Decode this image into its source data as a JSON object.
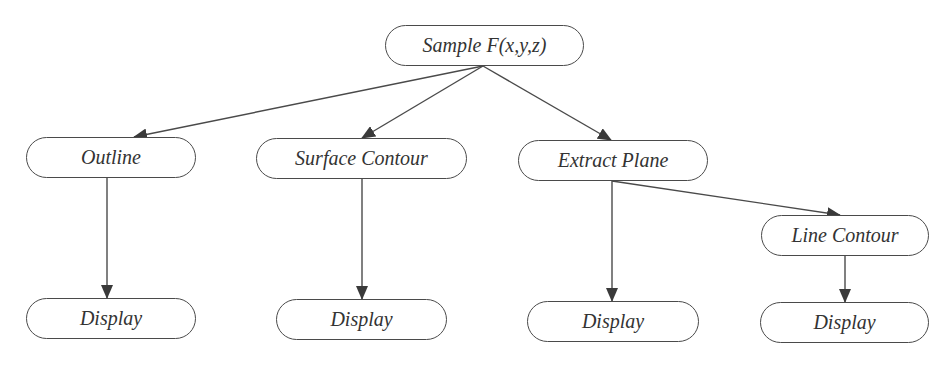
{
  "diagram": {
    "type": "flow-tree",
    "colors": {
      "stroke": "#4a4a4a",
      "text": "#333333",
      "background": "#ffffff"
    },
    "nodes": [
      {
        "id": "sample",
        "label": "Sample F(x,y,z)",
        "x": 385,
        "y": 25,
        "w": 199,
        "h": 41
      },
      {
        "id": "outline",
        "label": "Outline",
        "x": 26,
        "y": 137,
        "w": 170,
        "h": 41
      },
      {
        "id": "surface_contour",
        "label": "Surface Contour",
        "x": 256,
        "y": 138,
        "w": 211,
        "h": 41
      },
      {
        "id": "extract_plane",
        "label": "Extract Plane",
        "x": 518,
        "y": 140,
        "w": 190,
        "h": 41
      },
      {
        "id": "line_contour",
        "label": "Line Contour",
        "x": 761,
        "y": 215,
        "w": 168,
        "h": 41
      },
      {
        "id": "display_1",
        "label": "Display",
        "x": 26,
        "y": 298,
        "w": 170,
        "h": 41
      },
      {
        "id": "display_2",
        "label": "Display",
        "x": 276,
        "y": 299,
        "w": 171,
        "h": 41
      },
      {
        "id": "display_3",
        "label": "Display",
        "x": 527,
        "y": 301,
        "w": 172,
        "h": 41
      },
      {
        "id": "display_4",
        "label": "Display",
        "x": 760,
        "y": 302,
        "w": 169,
        "h": 41
      }
    ],
    "edges": [
      {
        "from": "sample",
        "to": "outline",
        "x1": 483,
        "y1": 66,
        "x2": 134,
        "y2": 137
      },
      {
        "from": "sample",
        "to": "surface_contour",
        "x1": 483,
        "y1": 66,
        "x2": 362,
        "y2": 138
      },
      {
        "from": "sample",
        "to": "extract_plane",
        "x1": 483,
        "y1": 66,
        "x2": 611,
        "y2": 140
      },
      {
        "from": "outline",
        "to": "display_1",
        "x1": 107,
        "y1": 178,
        "x2": 107,
        "y2": 298
      },
      {
        "from": "surface_contour",
        "to": "display_2",
        "x1": 362,
        "y1": 179,
        "x2": 362,
        "y2": 299
      },
      {
        "from": "extract_plane",
        "to": "line_contour",
        "x1": 612,
        "y1": 181,
        "x2": 840,
        "y2": 215
      },
      {
        "from": "extract_plane",
        "to": "display_3",
        "x1": 612,
        "y1": 181,
        "x2": 612,
        "y2": 301
      },
      {
        "from": "line_contour",
        "to": "display_4",
        "x1": 845,
        "y1": 256,
        "x2": 845,
        "y2": 302
      }
    ]
  }
}
